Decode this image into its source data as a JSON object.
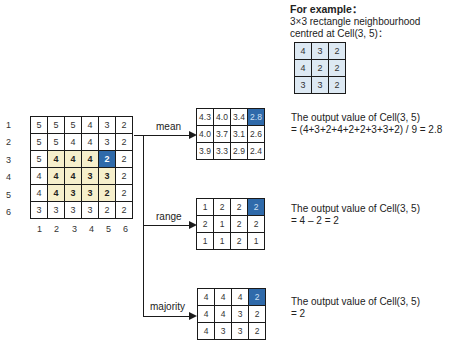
{
  "example": {
    "title": "For example：",
    "line1": "3×3  rectangle neighbourhood",
    "line2": "centred at Cell(3, 5)：",
    "grid": [
      [
        "4",
        "3",
        "2"
      ],
      [
        "4",
        "2",
        "2"
      ],
      [
        "3",
        "3",
        "2"
      ]
    ]
  },
  "input_grid": {
    "row_labels": [
      "1",
      "2",
      "3",
      "4",
      "5",
      "6"
    ],
    "col_labels": [
      "1",
      "2",
      "3",
      "4",
      "5",
      "6"
    ],
    "rows": [
      [
        "5",
        "5",
        "5",
        "4",
        "3",
        "2"
      ],
      [
        "5",
        "5",
        "4",
        "4",
        "3",
        "2"
      ],
      [
        "5",
        "4",
        "4",
        "4",
        "2",
        "2"
      ],
      [
        "4",
        "4",
        "4",
        "3",
        "3",
        "2"
      ],
      [
        "4",
        "4",
        "3",
        "3",
        "2",
        "2"
      ],
      [
        "3",
        "3",
        "3",
        "3",
        "2",
        "2"
      ]
    ],
    "highlight": {
      "rows": [
        3,
        5
      ],
      "cols": [
        2,
        5
      ]
    },
    "selected_cell": {
      "row": 3,
      "col": 5
    },
    "colors": {
      "highlight": "#f6efcc",
      "selected": "#2f6aaa"
    }
  },
  "operations": [
    {
      "label": "mean",
      "grid": [
        [
          "4.3",
          "4.0",
          "3.4",
          "2.8"
        ],
        [
          "4.0",
          "3.7",
          "3.1",
          "2.6"
        ],
        [
          "3.9",
          "3.3",
          "2.9",
          "2.4"
        ]
      ],
      "result_line1": "The output value of Cell(3, 5)",
      "result_line2": "= (4+3+2+4+2+2+3+3+2) / 9 = 2.8"
    },
    {
      "label": "range",
      "grid": [
        [
          "1",
          "2",
          "2",
          "2"
        ],
        [
          "2",
          "1",
          "2",
          "2"
        ],
        [
          "1",
          "1",
          "2",
          "1"
        ]
      ],
      "result_line1": "The output value of Cell(3, 5)",
      "result_line2": "= 4 – 2 = 2"
    },
    {
      "label": "majority",
      "grid": [
        [
          "4",
          "4",
          "4",
          "2"
        ],
        [
          "4",
          "4",
          "3",
          "2"
        ],
        [
          "4",
          "3",
          "3",
          "2"
        ]
      ],
      "result_line1": "The output value of Cell(3, 5)",
      "result_line2": "= 2"
    }
  ]
}
